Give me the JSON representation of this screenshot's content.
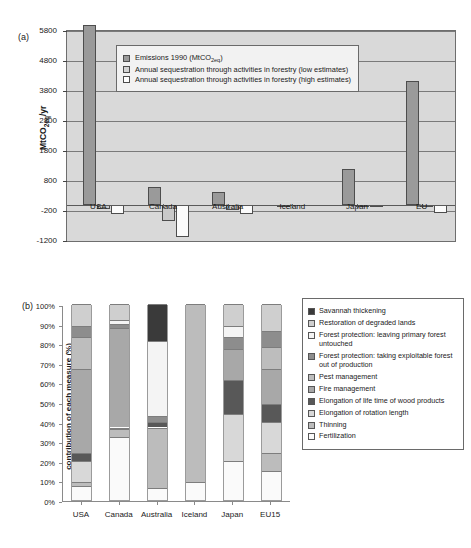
{
  "figure": {
    "panel_a_tag": "(a)",
    "panel_b_tag": "(b)"
  },
  "chart_data": [
    {
      "id": "panel_a",
      "type": "bar",
      "title": "",
      "xlabel": "",
      "ylabel": "MtCO2eq/yr",
      "ylabel_parts": {
        "pre": "MtCO",
        "sub": "2eq",
        "post": "/yr"
      },
      "ylim": [
        -1200,
        5800
      ],
      "yticks": [
        -1200,
        -200,
        800,
        1800,
        2800,
        3800,
        4800,
        5800
      ],
      "ytick_labels": [
        "-1200",
        "-200",
        "800",
        "1800",
        "2800",
        "3800",
        "4800",
        "5800"
      ],
      "grid": true,
      "legend_position": "inside-top-left",
      "categories": [
        "USA",
        "Canada",
        "Australia",
        "Iceland",
        "Japan",
        "EU"
      ],
      "series": [
        {
          "name": "Emissions 1990 (MtCO2eq)",
          "name_parts": {
            "pre": "Emissions 1990 (MtCO",
            "sub": "2eq",
            "post": ")"
          },
          "color": "#9a9a9a",
          "values": [
            6000,
            600,
            440,
            3,
            1200,
            4130
          ]
        },
        {
          "name": "Annual sequestration through activities in forestry (low estimates)",
          "color": "#c9c9c9",
          "values": [
            -130,
            -520,
            -160,
            0,
            -10,
            -80
          ]
        },
        {
          "name": "Annual sequestration through activities in forestry (high estimates)",
          "color": "#fbfbfb",
          "values": [
            -300,
            -1070,
            -290,
            0,
            -25,
            -250
          ]
        }
      ]
    },
    {
      "id": "panel_b",
      "type": "bar",
      "subtype": "stacked-100-percent",
      "title": "",
      "xlabel": "",
      "ylabel": "contribution of each measure (%)",
      "ylim": [
        0,
        100
      ],
      "yticks": [
        0,
        10,
        20,
        30,
        40,
        50,
        60,
        70,
        80,
        90,
        100
      ],
      "ytick_labels": [
        "0%",
        "10%",
        "20%",
        "30%",
        "40%",
        "50%",
        "60%",
        "70%",
        "80%",
        "90%",
        "100%"
      ],
      "grid": false,
      "legend_position": "right",
      "categories": [
        "USA",
        "Canada",
        "Australia",
        "Iceland",
        "Japan",
        "EU15"
      ],
      "series": [
        {
          "name": "Savannah thickening",
          "color": "#3a3a3a",
          "values": [
            0,
            0,
            19,
            0,
            0,
            0
          ]
        },
        {
          "name": "Restoration of degraded lands",
          "color": "#cfcfcf",
          "values": [
            11,
            8,
            0,
            0,
            11,
            14
          ]
        },
        {
          "name": "Forest protection: leaving primary forest untouched",
          "color": "#f4f4f4",
          "values": [
            0,
            2,
            38,
            0,
            6,
            0
          ]
        },
        {
          "name": "Forest protection: taking exploitable forest out of production",
          "color": "#8d8d8d",
          "values": [
            6,
            2,
            3,
            0,
            6,
            8
          ]
        },
        {
          "name": "Pest management",
          "color": "#bdbdbd",
          "values": [
            16,
            0,
            0,
            0,
            0,
            11
          ]
        },
        {
          "name": "Fire management",
          "color": "#a8a8a8",
          "values": [
            43,
            51,
            0,
            0,
            16,
            18
          ]
        },
        {
          "name": "Elongation of life time of wood products",
          "color": "#585858",
          "values": [
            4,
            0,
            3,
            0,
            17,
            9
          ]
        },
        {
          "name": "Elongation of rotation length",
          "color": "#d8d8d8",
          "values": [
            11,
            1,
            0,
            0,
            24,
            16
          ]
        },
        {
          "name": "Thinning",
          "color": "#bcbcbc",
          "values": [
            2,
            4,
            31,
            91,
            0,
            9
          ]
        },
        {
          "name": "Fertilization",
          "color": "#fafafa",
          "values": [
            7,
            32,
            6,
            9,
            20,
            15
          ]
        }
      ]
    }
  ]
}
